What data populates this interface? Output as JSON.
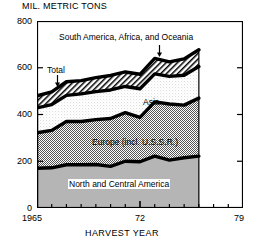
{
  "chart_data": {
    "type": "area",
    "stacked": true,
    "title": "",
    "ylabel": "MIL. METRIC TONS",
    "xlabel": "HARVEST YEAR",
    "ylim": [
      0,
      800
    ],
    "xlim": [
      1965,
      1979
    ],
    "yticks": [
      0,
      200,
      400,
      600,
      800
    ],
    "ytick_labels": [
      "0",
      "200",
      "400",
      "600",
      "800"
    ],
    "xticks": [
      1965,
      1966,
      1967,
      1968,
      1969,
      1970,
      1971,
      1972,
      1973,
      1974,
      1975,
      1976,
      1977,
      1978,
      1979
    ],
    "xtick_labels": [
      "1965",
      "72",
      "79"
    ],
    "xtick_label_positions": [
      1965,
      1972,
      1979
    ],
    "grid": false,
    "legend": "inline-annotations",
    "x": [
      1965,
      1966,
      1967,
      1968,
      1969,
      1970,
      1971,
      1972,
      1973,
      1974,
      1975,
      1976
    ],
    "series": [
      {
        "name": "North and Central America",
        "fill": "solid-gray",
        "values": [
          170,
          172,
          185,
          185,
          186,
          178,
          200,
          198,
          222,
          205,
          215,
          222
        ]
      },
      {
        "name": "Europe (incl. U.S.S.R.)",
        "fill": "fine-checker",
        "values": [
          152,
          160,
          185,
          185,
          192,
          205,
          208,
          190,
          232,
          240,
          225,
          248
        ]
      },
      {
        "name": "Asia",
        "fill": "stipple-white",
        "values": [
          106,
          110,
          112,
          118,
          120,
          122,
          112,
          122,
          120,
          118,
          128,
          135
        ]
      },
      {
        "name": "South America, Africa, and Oceania",
        "fill": "diagonal-hatch",
        "values": [
          52,
          55,
          58,
          57,
          60,
          62,
          62,
          62,
          66,
          62,
          70,
          72
        ]
      }
    ],
    "totals": [
      480,
      497,
      540,
      545,
      558,
      567,
      582,
      572,
      640,
      625,
      638,
      677
    ],
    "annotations": [
      {
        "text": "South America, Africa, and Oceania",
        "kind": "series-label"
      },
      {
        "text": "Total",
        "kind": "pointer-label"
      },
      {
        "text": "Asia",
        "kind": "series-label"
      },
      {
        "text": "Europe (incl. U.S.S.R.)",
        "kind": "series-label"
      },
      {
        "text": "North and Central America",
        "kind": "series-label"
      }
    ]
  },
  "axes": {
    "y_axis_title": "MIL. METRIC TONS",
    "x_axis_title": "HARVEST YEAR",
    "y_labels": [
      "800",
      "600",
      "400",
      "200",
      "0"
    ],
    "x_labels": [
      "1965",
      "72",
      "79"
    ]
  },
  "labels": {
    "south_america": "South America, Africa, and Oceania",
    "total": "Total",
    "asia": "Asia",
    "europe": "Europe (incl. U.S.S.R.)",
    "north_america": "North and Central America"
  }
}
